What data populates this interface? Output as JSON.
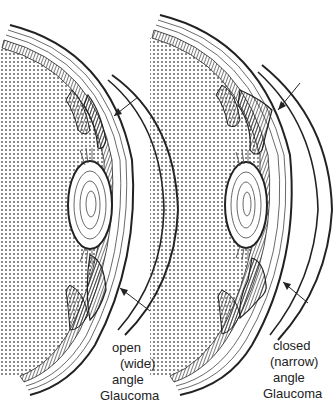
{
  "figure": {
    "type": "medical illustration",
    "panels": [
      {
        "id": "open",
        "label_lines": [
          "open",
          "(wide)",
          "angle",
          "Glaucoma"
        ],
        "arrows": 2
      },
      {
        "id": "closed",
        "label_lines": [
          "closed",
          "(narrow)",
          "angle",
          "Glaucoma"
        ],
        "arrows": 2
      }
    ],
    "colors": {
      "ink": "#222222",
      "background": "#ffffff"
    }
  }
}
